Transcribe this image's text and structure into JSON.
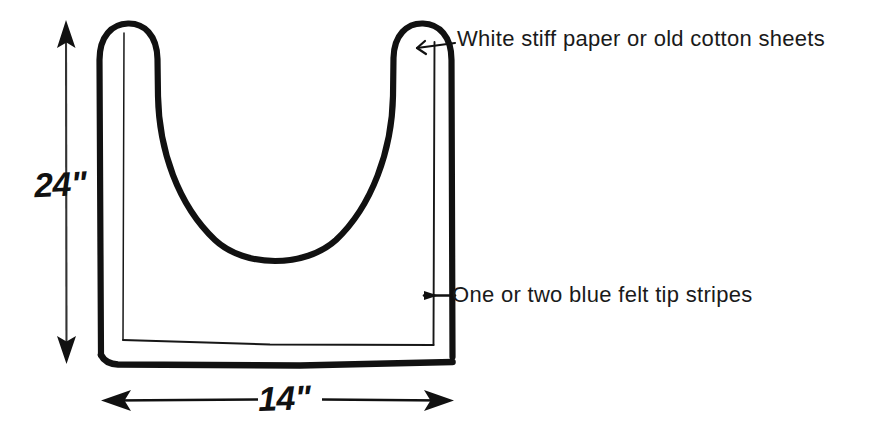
{
  "figure": {
    "kind": "hand-drawn-diagram",
    "background_color": "#ffffff",
    "ink_color": "#111111"
  },
  "annotations": [
    {
      "id": "material",
      "text": "White stiff paper or old cotton sheets",
      "points_to": "bag-right-handle"
    },
    {
      "id": "stripes",
      "text": "One or two blue felt tip stripes",
      "points_to": "bag-right-inner-stripe"
    }
  ],
  "dimensions": [
    {
      "id": "height",
      "value": "24\"",
      "orientation": "vertical",
      "arrow_style": "double-headed"
    },
    {
      "id": "width",
      "value": "14\"",
      "orientation": "horizontal",
      "arrow_style": "double-headed"
    }
  ],
  "icons": {
    "arrow_up": "arrow-up-icon",
    "arrow_down": "arrow-down-icon",
    "arrow_left": "arrow-left-icon",
    "arrow_right": "arrow-right-icon"
  }
}
